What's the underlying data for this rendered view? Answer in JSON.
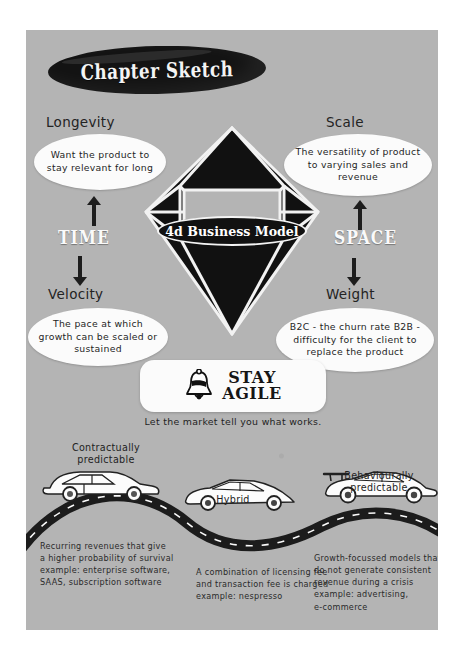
{
  "page": {
    "background": "#ffffff",
    "panel_color": "#b4b4b4"
  },
  "banner": {
    "title": "Chapter Sketch"
  },
  "diagram": {
    "core_label": "4d Business Model",
    "axis_vertical": "TIME",
    "axis_horizontal": "SPACE",
    "quadrants": [
      {
        "id": "longevity",
        "heading": "Longevity",
        "bubble": "Want the product to stay relevant for long",
        "arrow": "up"
      },
      {
        "id": "scale",
        "heading": "Scale",
        "bubble": "The versatility of product to varying sales and revenue",
        "arrow": "up"
      },
      {
        "id": "velocity",
        "heading": "Velocity",
        "bubble": "The pace at which growth can be scaled or sustained",
        "arrow": "down"
      },
      {
        "id": "weight",
        "heading": "Weight",
        "bubble": "B2C - the churn rate\nB2B - difficulty for the client to replace the product",
        "arrow": "down"
      }
    ]
  },
  "agile": {
    "icon": "bell-icon",
    "line1": "STAY",
    "line2": "AGILE",
    "caption": "Let the market tell you what works."
  },
  "road": {
    "cars": [
      {
        "id": "contractually-predictable",
        "label": "Contractually\npredictable",
        "note": "Recurring revenues that give\na higher probability of survival\nexample: enterprise software,\nSAAS, subscription software"
      },
      {
        "id": "hybrid",
        "label": "Hybrid",
        "note": "A combination of licensing fee\nand transaction fee is charged\nexample: nespresso"
      },
      {
        "id": "behaviourally-predictable",
        "label": "Behaviourally\npredictable",
        "note": "Growth-focussed models that\ndo not generate consistent\nrevenue during a crisis\nexample: advertising,\ne-commerce"
      }
    ]
  }
}
